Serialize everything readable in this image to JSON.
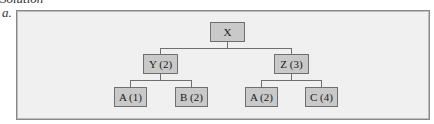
{
  "heading": "Solution",
  "part_label": "a.",
  "tree": {
    "root": {
      "label": "X"
    },
    "level1": [
      {
        "label": "Y (2)"
      },
      {
        "label": "Z (3)"
      }
    ],
    "level2": [
      {
        "label": "A (1)",
        "parent": "Y (2)"
      },
      {
        "label": "B (2)",
        "parent": "Y (2)"
      },
      {
        "label": "A (2)",
        "parent": "Z (3)"
      },
      {
        "label": "C (4)",
        "parent": "Z (3)"
      }
    ]
  },
  "colors": {
    "frame_bg": "#f0f0f0",
    "node_fill": "#c9c9c9",
    "node_border": "#6f6f6f",
    "connector": "#6f6f6f"
  }
}
